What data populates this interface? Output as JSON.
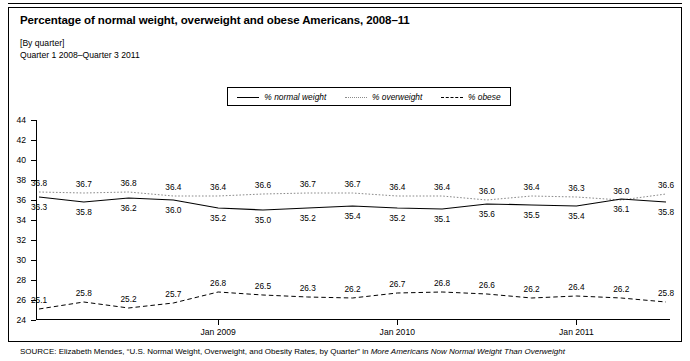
{
  "figure": {
    "title": "Percentage of normal weight, overweight and obese Americans, 2008–11",
    "subtitle_units": "[By quarter]",
    "subtitle_range": "Quarter 1 2008–Quarter 3 2011",
    "source_prefix": "SOURCE:",
    "source_text": " Elizabeth Mendes, “U.S. Normal Weight, Overweight, and Obesity Rates, by Quarter” in ",
    "source_italic": "More Americans Now Normal Weight Than Overweight"
  },
  "legend": {
    "position": "top-center",
    "items": [
      {
        "label": "% normal weight",
        "style": "solid",
        "color": "#000000"
      },
      {
        "label": "% overweight",
        "style": "dotted",
        "color": "#8a8a8a"
      },
      {
        "label": "% obese",
        "style": "dashed",
        "color": "#000000"
      }
    ]
  },
  "chart_data": {
    "type": "line",
    "title": "Percentage of normal weight, overweight and obese Americans, 2008–11",
    "subtitle": "[By quarter] Quarter 1 2008–Quarter 3 2011",
    "xlabel": "",
    "ylabel": "",
    "grid": false,
    "ylim": [
      24,
      44
    ],
    "yticks": [
      24,
      26,
      28,
      30,
      32,
      34,
      36,
      38,
      40,
      42,
      44
    ],
    "x": [
      "Q1 2008",
      "Q2 2008",
      "Q3 2008",
      "Q4 2008",
      "Q1 2009",
      "Q2 2009",
      "Q3 2009",
      "Q4 2009",
      "Q1 2010",
      "Q2 2010",
      "Q3 2010",
      "Q4 2010",
      "Q1 2011",
      "Q2 2011",
      "Q3 2011"
    ],
    "xtick_labels": [
      "Jan 2009",
      "Jan 2010",
      "Jan 2011"
    ],
    "xtick_indices": [
      4,
      8,
      12
    ],
    "series": [
      {
        "name": "% overweight",
        "style": "dotted",
        "color": "#8a8a8a",
        "label_offset": -9,
        "values": [
          36.8,
          36.7,
          36.8,
          36.4,
          36.4,
          36.6,
          36.7,
          36.7,
          36.4,
          36.4,
          36.0,
          36.4,
          36.3,
          36.0,
          36.6
        ]
      },
      {
        "name": "% normal weight",
        "style": "solid",
        "color": "#000000",
        "label_offset": 10,
        "values": [
          36.3,
          35.8,
          36.2,
          36.0,
          35.2,
          35.0,
          35.2,
          35.4,
          35.2,
          35.1,
          35.6,
          35.5,
          35.4,
          36.1,
          35.8
        ]
      },
      {
        "name": "% obese",
        "style": "dashed",
        "color": "#000000",
        "label_offset": -9,
        "values": [
          25.1,
          25.8,
          25.2,
          25.7,
          26.8,
          26.5,
          26.3,
          26.2,
          26.7,
          26.8,
          26.6,
          26.2,
          26.4,
          26.2,
          25.8
        ]
      }
    ]
  }
}
